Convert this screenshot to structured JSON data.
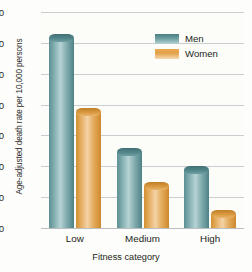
{
  "chart_data": {
    "type": "bar",
    "title": "",
    "subtitle": "",
    "xlabel": "Fitness category",
    "ylabel": "Age-adjusted death rate per 10,000 persons",
    "categories": [
      "Low",
      "Medium",
      "High"
    ],
    "series": [
      {
        "name": "Men",
        "values": [
          63,
          26,
          20
        ],
        "color": "#6c9ea2"
      },
      {
        "name": "Women",
        "values": [
          39,
          15,
          6
        ],
        "color": "#e2a049"
      }
    ],
    "ylim": [
      0,
      70
    ],
    "yticks": [
      0,
      10,
      20,
      30,
      40,
      50,
      60,
      70
    ],
    "ytick_labels": [
      "0",
      "10",
      "20",
      "30",
      "40",
      "50",
      "60",
      "70"
    ],
    "grid": true,
    "legend_position": "top-right",
    "legend": [
      "Men",
      "Women"
    ]
  },
  "colors": {
    "men": "#6c9ea2",
    "women": "#e2a049",
    "gridline": "#c9cfd1",
    "text": "#231f20",
    "background": "#fdfdfb"
  }
}
